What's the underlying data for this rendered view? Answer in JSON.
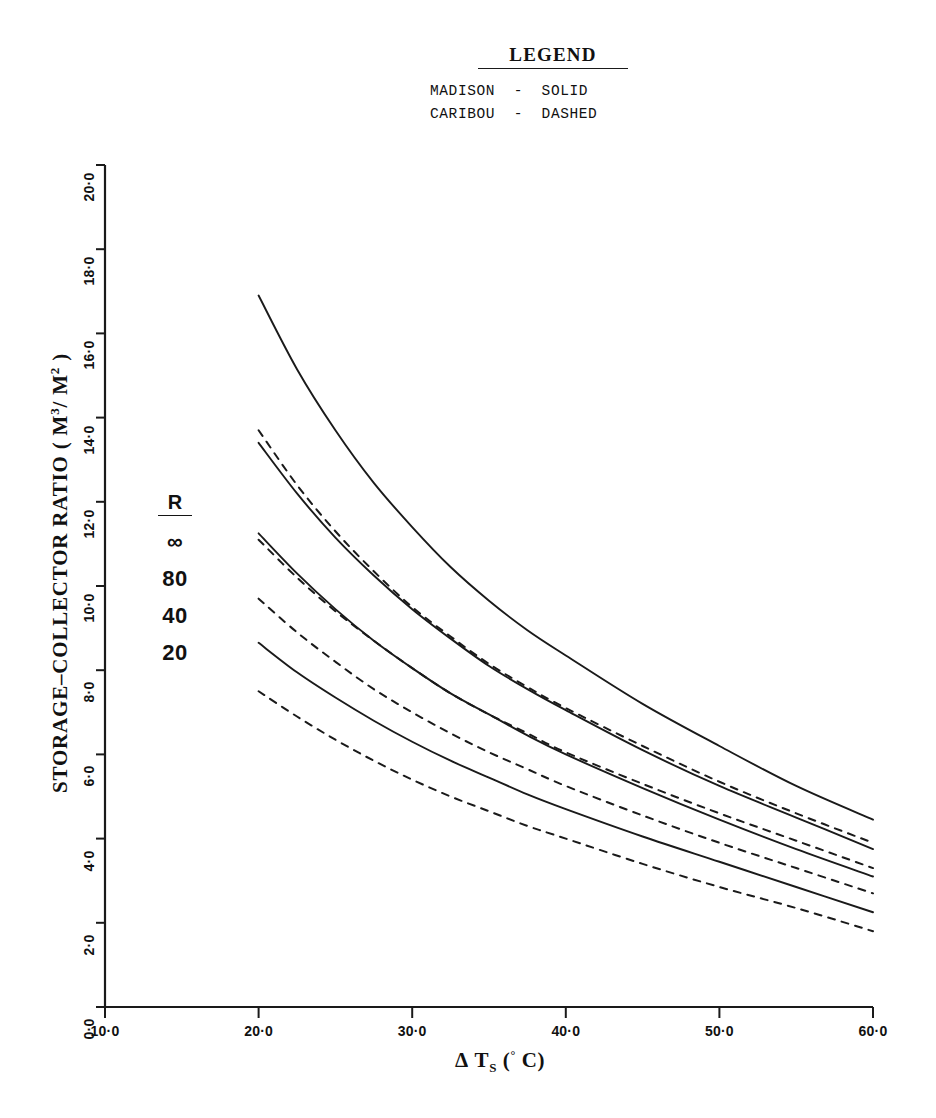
{
  "legend": {
    "title": "LEGEND",
    "entries": [
      "MADISON  -  SOLID",
      "CARIBOU  -  DASHED"
    ]
  },
  "r_key": {
    "header": "R",
    "values": [
      "∞",
      "80",
      "40",
      "20"
    ]
  },
  "axes": {
    "x": {
      "title_parts": {
        "delta": "Δ",
        "symbol": "T",
        "subscript": "S",
        "units_open": "(",
        "degree": "°",
        "unit": "C",
        "units_close": ")"
      },
      "title_plain": "Δ Tₛ (° C)",
      "ticks": [
        "10·0",
        "20·0",
        "30·0",
        "40·0",
        "50·0",
        "60·0"
      ],
      "tick_values": [
        10,
        20,
        30,
        40,
        50,
        60
      ],
      "min": 10,
      "max": 60
    },
    "y": {
      "title_plain": "STORAGE-COLLECTOR RATIO ( M³/ M² )",
      "title_parts": {
        "main": "STORAGE–COLLECTOR RATIO ( M",
        "sup1": "3",
        "slash": "/ M",
        "sup2": "2",
        "close": " )"
      },
      "ticks": [
        "0·0",
        "2·0",
        "4·0",
        "6·0",
        "8·0",
        "10·0",
        "12·0",
        "14·0",
        "16·0",
        "18·0",
        "20·0"
      ],
      "tick_values": [
        0,
        2,
        4,
        6,
        8,
        10,
        12,
        14,
        16,
        18,
        20
      ],
      "min": 0,
      "max": 20
    }
  },
  "colors": {
    "ink": "#1a1a1a",
    "background": "#ffffff"
  },
  "chart_data": {
    "type": "line",
    "title": "",
    "xlabel": "Δ Tₛ (° C)",
    "ylabel": "STORAGE-COLLECTOR RATIO ( M³/ M² )",
    "xlim": [
      10,
      60
    ],
    "ylim": [
      0,
      20
    ],
    "grid": false,
    "legend_position": "top-center",
    "x": [
      20,
      22.5,
      25,
      27.5,
      30,
      32.5,
      35,
      37.5,
      40,
      45,
      50,
      55,
      60
    ],
    "series": [
      {
        "name": "MADISON R=∞",
        "location": "MADISON",
        "R": "∞",
        "style": "solid",
        "values": [
          16.9,
          15.15,
          13.7,
          12.45,
          11.4,
          10.45,
          9.65,
          8.95,
          8.35,
          7.2,
          6.2,
          5.25,
          4.45
        ]
      },
      {
        "name": "MADISON R=80",
        "location": "MADISON",
        "R": "80",
        "style": "solid",
        "values": [
          13.4,
          12.2,
          11.15,
          10.25,
          9.45,
          8.75,
          8.1,
          7.55,
          7.05,
          6.1,
          5.25,
          4.5,
          3.75
        ]
      },
      {
        "name": "MADISON R=40",
        "location": "MADISON",
        "R": "40",
        "style": "solid",
        "values": [
          11.25,
          10.3,
          9.45,
          8.7,
          8.05,
          7.45,
          6.95,
          6.45,
          6.0,
          5.2,
          4.45,
          3.75,
          3.1
        ]
      },
      {
        "name": "MADISON R=20",
        "location": "MADISON",
        "R": "20",
        "style": "solid",
        "values": [
          8.65,
          7.95,
          7.35,
          6.8,
          6.3,
          5.85,
          5.45,
          5.05,
          4.7,
          4.05,
          3.45,
          2.85,
          2.25
        ]
      },
      {
        "name": "CARIBOU R=∞",
        "location": "CARIBOU",
        "R": "∞",
        "style": "dashed",
        "values": [
          13.7,
          12.4,
          11.3,
          10.35,
          9.5,
          8.8,
          8.15,
          7.6,
          7.1,
          6.2,
          5.35,
          4.6,
          3.9
        ]
      },
      {
        "name": "CARIBOU R=80",
        "location": "CARIBOU",
        "R": "80",
        "style": "dashed",
        "values": [
          11.1,
          10.2,
          9.4,
          8.7,
          8.05,
          7.45,
          6.95,
          6.5,
          6.05,
          5.3,
          4.6,
          3.95,
          3.3
        ]
      },
      {
        "name": "CARIBOU R=40",
        "location": "CARIBOU",
        "R": "40",
        "style": "dashed",
        "values": [
          9.7,
          8.9,
          8.2,
          7.55,
          7.0,
          6.5,
          6.05,
          5.65,
          5.25,
          4.55,
          3.9,
          3.3,
          2.7
        ]
      },
      {
        "name": "CARIBOU R=20",
        "location": "CARIBOU",
        "R": "20",
        "style": "dashed",
        "values": [
          7.5,
          6.9,
          6.35,
          5.85,
          5.4,
          5.0,
          4.65,
          4.3,
          4.0,
          3.4,
          2.85,
          2.35,
          1.8
        ]
      }
    ]
  }
}
